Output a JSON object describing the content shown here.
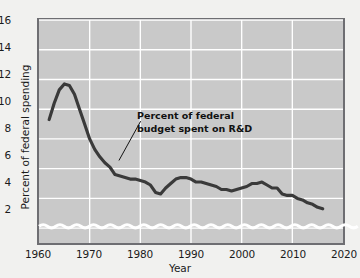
{
  "chart_data": {
    "type": "line",
    "title": "",
    "xlabel": "Year",
    "ylabel": "Percent of federal spending",
    "xlim": [
      1960,
      2020
    ],
    "ylim": [
      1.0,
      16
    ],
    "y_axis_break": true,
    "y_axis_break_note": "wavy break below lowest tick; axis does not reach zero",
    "grid": true,
    "legend": "none",
    "xticks": [
      1960,
      1970,
      1980,
      1990,
      2000,
      2010,
      2020
    ],
    "yticks": [
      2,
      4,
      6,
      8,
      10,
      12,
      14,
      16
    ],
    "annotations": [
      {
        "text_lines": [
          "Percent of federal",
          "budget spent on R&D"
        ],
        "leader_from": [
          140,
          121
        ],
        "leader_to": [
          118,
          161
        ]
      }
    ],
    "series": [
      {
        "name": "Percent of federal budget spent on R&D",
        "color": "#3a3a3a",
        "x": [
          1962,
          1963,
          1964,
          1965,
          1966,
          1967,
          1968,
          1969,
          1970,
          1971,
          1972,
          1973,
          1974,
          1975,
          1976,
          1977,
          1978,
          1979,
          1980,
          1981,
          1982,
          1983,
          1984,
          1985,
          1986,
          1987,
          1988,
          1989,
          1990,
          1991,
          1992,
          1993,
          1994,
          1995,
          1996,
          1997,
          1998,
          1999,
          2000,
          2001,
          2002,
          2003,
          2004,
          2005,
          2006,
          2007,
          2008,
          2009,
          2010,
          2011,
          2012,
          2013,
          2014,
          2015,
          2016
        ],
        "values": [
          9.3,
          10.4,
          11.3,
          11.7,
          11.6,
          11.0,
          10.0,
          9.0,
          8.0,
          7.3,
          6.8,
          6.4,
          6.1,
          5.6,
          5.5,
          5.4,
          5.3,
          5.3,
          5.2,
          5.1,
          4.9,
          4.4,
          4.3,
          4.7,
          5.0,
          5.3,
          5.4,
          5.4,
          5.3,
          5.1,
          5.1,
          5.0,
          4.9,
          4.8,
          4.6,
          4.6,
          4.5,
          4.6,
          4.7,
          4.8,
          5.0,
          5.0,
          5.1,
          4.9,
          4.7,
          4.7,
          4.3,
          4.2,
          4.2,
          4.0,
          3.9,
          3.7,
          3.6,
          3.4,
          3.3
        ]
      }
    ]
  },
  "axis": {
    "y_tick_labels": [
      "16",
      "14",
      "12",
      "10",
      "8",
      "6",
      "4",
      "2"
    ],
    "x_tick_labels": [
      "1960",
      "1970",
      "1980",
      "1990",
      "2000",
      "2010",
      "2020"
    ],
    "y_title": "Percent of federal spending",
    "x_title": "Year"
  },
  "annotation": {
    "line1": "Percent of federal",
    "line2": "budget spent on R&D"
  },
  "colors": {
    "plot_background": "#c9c9c9",
    "page_background": "#f1f1ef",
    "gridline": "#ffffff",
    "series_line": "#3a3a3a",
    "frame": "#6e6e72",
    "break_wave": "#ffffff",
    "text": "#1b1b1b"
  }
}
